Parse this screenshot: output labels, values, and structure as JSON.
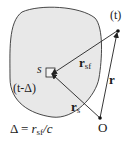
{
  "diagram": {
    "labels": {
      "source": "s",
      "retarded_time": "(t-Δ)",
      "field_time": "(t)",
      "origin": "O",
      "r_sf_main": "r",
      "r_sf_sub": "sf",
      "r_main": "r",
      "r_s_main": "r",
      "r_s_sub": "s",
      "eq_delta": "Δ = ",
      "eq_r": "r",
      "eq_sub": "sf",
      "eq_tail": "/c"
    },
    "colors": {
      "region_fill": "#e8e8e8",
      "stroke": "#333333"
    }
  }
}
